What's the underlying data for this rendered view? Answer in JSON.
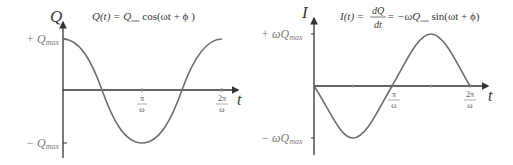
{
  "left_plot": {
    "y_axis_label": "Q",
    "x_axis_label": "t",
    "equation": {
      "lhs": "Q(t) = Q",
      "sub": "max",
      "rhs": " cos(ωt + ϕ )"
    },
    "y_ticks": [
      {
        "sign": "+ ",
        "symbol": "Q",
        "sub": "max"
      },
      {
        "sign": "− ",
        "symbol": "Q",
        "sub": "max"
      }
    ],
    "x_ticks": [
      {
        "num": "π",
        "den": "ω"
      },
      {
        "num": "2π",
        "den": "ω"
      }
    ],
    "curve": "cosine"
  },
  "right_plot": {
    "y_axis_label": "I",
    "x_axis_label": "t",
    "equation": {
      "lhs": "I(t) = ",
      "frac_num": "dQ",
      "frac_den": "dt",
      "mid": " = −ωQ",
      "sub": "max",
      "rhs": " sin(ωt + ϕ)"
    },
    "y_ticks": [
      {
        "sign": "+ ",
        "symbol": "ωQ",
        "sub": "max"
      },
      {
        "sign": "− ",
        "symbol": "ωQ",
        "sub": "max"
      }
    ],
    "x_ticks": [
      {
        "num": "π",
        "den": "ω"
      },
      {
        "num": "2π",
        "den": "ω"
      }
    ],
    "curve": "negative sine"
  },
  "colors": {
    "curve": "#6e6e6e",
    "axis": "#333333",
    "tick_label": "#8a8a8a"
  }
}
